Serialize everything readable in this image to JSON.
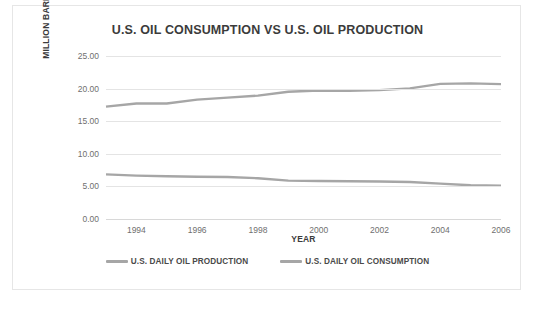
{
  "chart_data": {
    "type": "line",
    "title": "U.S. OIL CONSUMPTION VS U.S. OIL PRODUCTION",
    "xlabel": "YEAR",
    "ylabel": "MILLION BARRELS/DAY",
    "xlim": [
      1993,
      2006
    ],
    "ylim": [
      0,
      25
    ],
    "ytick_labels": [
      "25.00",
      "20.00",
      "15.00",
      "10.00",
      "5.00",
      "0.00"
    ],
    "ytick_values": [
      25,
      20,
      15,
      10,
      5,
      0
    ],
    "xtick_labels": [
      "1994",
      "1996",
      "1998",
      "2000",
      "2002",
      "2004",
      "2006"
    ],
    "xtick_values": [
      1994,
      1996,
      1998,
      2000,
      2002,
      2004,
      2006
    ],
    "x": [
      1993,
      1994,
      1995,
      1996,
      1997,
      1998,
      1999,
      2000,
      2001,
      2002,
      2003,
      2004,
      2005,
      2006
    ],
    "grid": true,
    "legend_position": "bottom",
    "series": [
      {
        "name": "U.S. DAILY OIL PRODUCTION",
        "color": "#a6a6a6",
        "values": [
          6.85,
          6.66,
          6.56,
          6.47,
          6.45,
          6.25,
          5.88,
          5.82,
          5.8,
          5.75,
          5.68,
          5.42,
          5.18,
          5.1
        ]
      },
      {
        "name": "U.S. DAILY OIL CONSUMPTION",
        "color": "#a6a6a6",
        "values": [
          17.24,
          17.72,
          17.72,
          18.31,
          18.62,
          18.92,
          19.52,
          19.7,
          19.65,
          19.76,
          20.03,
          20.73,
          20.8,
          20.69
        ]
      }
    ]
  },
  "colors": {
    "grid": "#e4e4e4",
    "axis_text": "#6f6f6f",
    "title_text": "#3b3b3b",
    "card_border": "#e6e6e6",
    "line": "#a6a6a6"
  }
}
